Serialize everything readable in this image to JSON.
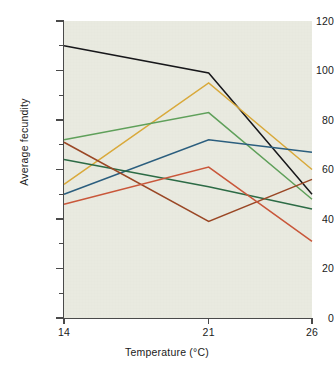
{
  "chart_data": {
    "type": "line",
    "title": "",
    "xlabel": "Temperature (°C)",
    "ylabel": "Average fecundity",
    "x": [
      14,
      21,
      26
    ],
    "categories": [
      "14",
      "21",
      "26"
    ],
    "xlim": [
      14,
      26
    ],
    "ylim": [
      0,
      120
    ],
    "ytick_labels": [
      "0",
      "20",
      "40",
      "60",
      "80",
      "100",
      "120"
    ],
    "ytick_values": [
      0,
      20,
      40,
      60,
      80,
      100,
      120
    ],
    "ytick_minor_values": [
      10,
      30,
      50,
      70,
      90,
      110
    ],
    "xtick_labels": [
      "14",
      "21",
      "26"
    ],
    "xtick_values": [
      14,
      21,
      26
    ],
    "grid": false,
    "legend": "none",
    "plot_background": "#e9eae0",
    "series": [
      {
        "name": "black-line",
        "color": "#17171a",
        "values": [
          110,
          99,
          50
        ]
      },
      {
        "name": "gold-line",
        "color": "#d9a93a",
        "values": [
          54,
          95,
          60
        ]
      },
      {
        "name": "light-green-line",
        "color": "#5fa05a",
        "values": [
          72,
          83,
          48
        ]
      },
      {
        "name": "blue-line",
        "color": "#2b5e7e",
        "values": [
          50,
          72,
          67
        ]
      },
      {
        "name": "dark-green-line",
        "color": "#2c6b45",
        "values": [
          64,
          53,
          44
        ]
      },
      {
        "name": "brick-red-line",
        "color": "#9a4725",
        "values": [
          71,
          39,
          56
        ]
      },
      {
        "name": "orange-red-line",
        "color": "#c9573a",
        "values": [
          46,
          61,
          31
        ]
      }
    ]
  },
  "axes": {
    "y_title": "Average fecundity",
    "x_title": "Temperature (°C)",
    "y_labels": [
      "120",
      "100",
      "80",
      "60",
      "40",
      "20",
      "0"
    ],
    "x_labels": [
      "14",
      "21",
      "26"
    ]
  }
}
